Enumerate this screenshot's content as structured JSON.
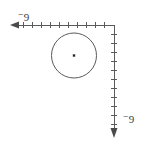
{
  "diagram": {
    "type": "coordinate-axes-with-circle",
    "background_color": "#ffffff",
    "stroke_color": "#5a5a5a",
    "label_color": "#3a3a3a",
    "labels": {
      "horizontal_axis": {
        "minus_sign": "−",
        "number": "9",
        "full": "−9"
      },
      "vertical_axis": {
        "minus_sign": "−",
        "number": "9",
        "full": "−9"
      }
    },
    "horizontal_axis": {
      "name": "x-axis",
      "orientation": "horizontal",
      "y": 25,
      "x_start": 12,
      "x_end": 114,
      "arrow_direction": "left",
      "tick_spacing": 9,
      "tick_count": 11,
      "tick_half_length": 3
    },
    "vertical_axis": {
      "name": "y-axis",
      "orientation": "vertical",
      "x": 114,
      "y_start": 25,
      "y_end": 137,
      "arrow_direction": "down",
      "tick_spacing": 9,
      "tick_count": 11,
      "tick_half_length": 3
    },
    "circle": {
      "name": "circle",
      "center_x": 74,
      "center_y": 55.5,
      "radius": 22.5,
      "stroke_width": 1,
      "fill": "none"
    },
    "center_point": {
      "name": "circle-center-dot",
      "x": 74,
      "y": 55.5,
      "size": 2.4
    }
  }
}
